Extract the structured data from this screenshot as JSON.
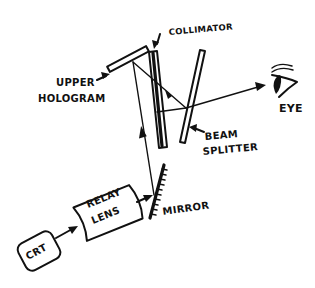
{
  "diagram": {
    "labels": {
      "upper_hologram_line1": "UPPER",
      "upper_hologram_line2": "HOLOGRAM",
      "collimator": "COLLIMATOR",
      "beam_splitter_line1": "BEAM",
      "beam_splitter_line2": "SPLITTER",
      "eye": "EYE",
      "relay_lens_line1": "RELAY",
      "relay_lens_line2": "LENS",
      "mirror": "MIRROR",
      "crt": "CRT"
    },
    "components": [
      "CRT",
      "RELAY LENS",
      "MIRROR",
      "UPPER HOLOGRAM",
      "COLLIMATOR",
      "BEAM SPLITTER",
      "EYE"
    ],
    "colors": {
      "ink": "#111111",
      "paper": "#ffffff"
    }
  }
}
